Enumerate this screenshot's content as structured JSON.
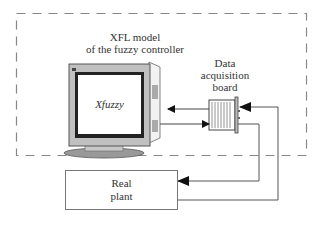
{
  "diagram": {
    "controller_region": {
      "style": "dashed",
      "title_line1": "XFL model",
      "title_line2": "of the fuzzy controller"
    },
    "computer": {
      "screen_label": "Xfuzzy"
    },
    "board": {
      "label_line1": "Data",
      "label_line2": "acquisition",
      "label_line3": "board"
    },
    "plant": {
      "label_line1": "Real",
      "label_line2": "plant"
    },
    "connections": [
      {
        "from": "board",
        "to": "computer"
      },
      {
        "from": "computer",
        "to": "board"
      },
      {
        "from": "board",
        "to": "plant"
      },
      {
        "from": "plant",
        "to": "board"
      }
    ],
    "colors": {
      "line": "#555555",
      "dashed": "#888888",
      "monitor_bezel": "#bdbdbd",
      "monitor_screen_border": "#222222"
    }
  }
}
